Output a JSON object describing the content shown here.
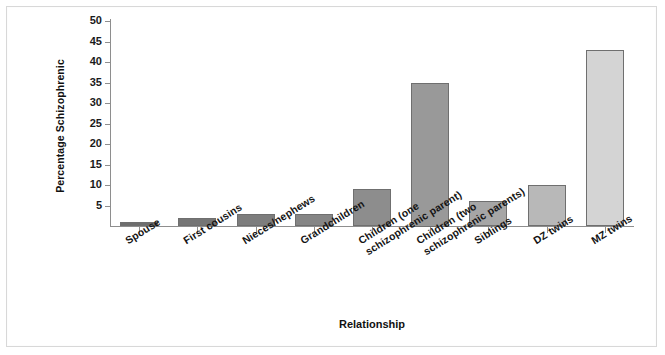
{
  "chart_data": {
    "type": "bar",
    "title": "",
    "xlabel": "Relationship",
    "ylabel": "Percentage Schizophrenic",
    "ylim": [
      0,
      50
    ],
    "ytick_step": 5,
    "yticks": [
      "50",
      "45",
      "40",
      "35",
      "30",
      "25",
      "20",
      "15",
      "10",
      "5"
    ],
    "grid": false,
    "legend": "none",
    "categories": [
      "Spouse",
      "First cousins",
      "Nieces/nephews",
      "Grandchildren",
      "Children (one\nschizophrenic parent)",
      "Children (two\nschizophrenic parents)",
      "Siblings",
      "DZ twins",
      "MZ twins"
    ],
    "values": [
      1,
      2,
      3,
      3,
      9,
      35,
      6,
      10,
      43
    ],
    "bar_colors": [
      "#6e6e6e",
      "#757575",
      "#7d7d7d",
      "#858585",
      "#8d8d8d",
      "#999999",
      "#a6a6a6",
      "#b8b8b8",
      "#d4d4d4"
    ],
    "bar_border_color": "#6f6f6f",
    "axis_color": "#8e8e8e",
    "frame_color": "#d8d8d8",
    "background_color": "#ffffff"
  }
}
